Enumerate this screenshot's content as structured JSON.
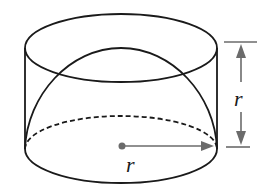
{
  "figure": {
    "type": "geometry",
    "colors": {
      "stroke": "#1a1a1a",
      "annotation": "#6b6b6b",
      "background": "#ffffff"
    },
    "labels": {
      "height_label": "r",
      "radius_label": "r"
    },
    "shapes": {
      "cylinder": {
        "cx": 121,
        "top_cy": 48,
        "bottom_cy": 149,
        "rx": 96,
        "ry": 34
      },
      "hemisphere": {
        "apex_y": 48,
        "base_cy": 149
      },
      "center_point": {
        "x": 122,
        "y": 146
      }
    }
  }
}
